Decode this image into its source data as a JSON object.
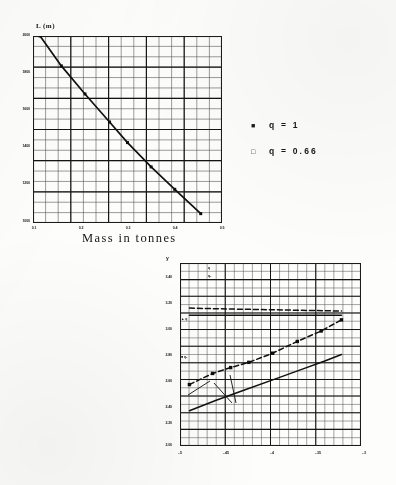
{
  "page": {
    "background_color": "#fdfdfc",
    "ink_color": "#1a1a1a"
  },
  "legend": {
    "name": "plot-legend",
    "entries": [
      {
        "marker": "filled-square",
        "glyph": "■",
        "label": "q  =  1"
      },
      {
        "marker": "open-square",
        "glyph": "□",
        "label": "q  =  0.66"
      }
    ]
  },
  "chart_data": [
    {
      "id": "top-chart",
      "type": "line",
      "title": "",
      "xlabel": "Mass in tonnes",
      "ylabel": "L (m)",
      "grid": true,
      "legend_position": "right-outside",
      "xlim": [
        0.1,
        0.5
      ],
      "ylim": [
        1000,
        2000
      ],
      "xticks": [
        0.1,
        0.2,
        0.3,
        0.4,
        0.5
      ],
      "xticklabels": [
        "0.1",
        "0.2",
        "0.3",
        "0.4",
        "0.5"
      ],
      "yticks": [
        1000,
        1200,
        1400,
        1600,
        1800,
        2000
      ],
      "yticklabels": [
        "1000",
        "1200",
        "1400",
        "1600",
        "1800",
        "2000"
      ],
      "series": [
        {
          "name": "q = 1",
          "style": "solid-with-markers",
          "marker": "filled-square",
          "x": [
            0.115,
            0.16,
            0.21,
            0.262,
            0.3,
            0.35,
            0.4,
            0.455
          ],
          "y": [
            2000,
            1840,
            1690,
            1540,
            1430,
            1300,
            1180,
            1050
          ]
        }
      ]
    },
    {
      "id": "bottom-chart",
      "type": "line",
      "title": "",
      "xlabel": "",
      "ylabel": "y",
      "grid": true,
      "legend_position": "none",
      "xlim": [
        -0.5,
        -0.25
      ],
      "ylim": [
        2.0,
        3.4
      ],
      "xticks": [
        -0.5,
        -0.45,
        -0.4,
        -0.35,
        -0.3
      ],
      "xticklabels": [
        "-.5",
        "-.45",
        "-.4",
        "-.35",
        "-.3"
      ],
      "yticks": [
        2.0,
        2.2,
        2.4,
        2.6,
        2.8,
        3.0,
        3.2,
        3.4
      ],
      "yticklabels": [
        "2.00",
        "2.20",
        "2.40",
        "2.60",
        "2.80",
        "3.00",
        "3.20",
        "3.40"
      ],
      "annotations": [
        {
          "text": "q",
          "x": 6,
          "y": 3
        },
        {
          "text": "q₁",
          "x": 6,
          "y": 11
        },
        {
          "text": "▲ q",
          "x": 1,
          "y": 55
        },
        {
          "text": "■ q₁",
          "x": 1,
          "y": 93
        }
      ],
      "series": [
        {
          "name": "upper-dashed-flat",
          "style": "dashed",
          "marker": "none",
          "x": [
            -0.487,
            -0.45,
            -0.4,
            -0.35,
            -0.3,
            -0.277
          ],
          "y": [
            3.055,
            3.05,
            3.045,
            3.04,
            3.035,
            3.032
          ]
        },
        {
          "name": "upper-solid-flat",
          "style": "solid",
          "marker": "none",
          "x": [
            -0.487,
            -0.45,
            -0.4,
            -0.35,
            -0.3,
            -0.277
          ],
          "y": [
            3.0,
            3.0,
            3.0,
            3.0,
            3.0,
            3.0
          ]
        },
        {
          "name": "mid-dashed-rising",
          "style": "dashed-with-markers",
          "marker": "filled-square",
          "x": [
            -0.487,
            -0.455,
            -0.43,
            -0.405,
            -0.372,
            -0.338,
            -0.305,
            -0.277
          ],
          "y": [
            2.47,
            2.555,
            2.6,
            2.64,
            2.71,
            2.8,
            2.88,
            2.965
          ]
        },
        {
          "name": "lower-solid-rising",
          "style": "solid",
          "marker": "none",
          "x": [
            -0.487,
            -0.45,
            -0.41,
            -0.37,
            -0.33,
            -0.3,
            -0.277
          ],
          "y": [
            2.27,
            2.35,
            2.43,
            2.51,
            2.59,
            2.65,
            2.7
          ]
        }
      ]
    }
  ]
}
